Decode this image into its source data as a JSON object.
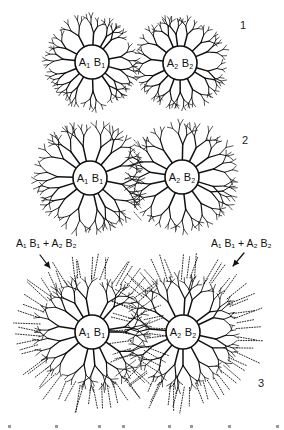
{
  "figure": {
    "type": "neuron-dendrite-growth-diagram",
    "ink_color": "#111111",
    "background": "#ffffff",
    "stages": [
      {
        "label": "1",
        "label_pos": [
          240,
          19
        ],
        "cells": [
          {
            "id": "A1B1",
            "text_a": "A",
            "sub_a": "1",
            "text_b": "B",
            "sub_b": "1",
            "cx": 92,
            "cy": 62,
            "r": 17,
            "reach": 46,
            "dotted_reach": 0,
            "seed": 11
          },
          {
            "id": "A2B2",
            "text_a": "A",
            "sub_a": "2",
            "text_b": "B",
            "sub_b": "2",
            "cx": 180,
            "cy": 63,
            "r": 17,
            "reach": 46,
            "dotted_reach": 0,
            "seed": 23
          }
        ]
      },
      {
        "label": "2",
        "label_pos": [
          242,
          134
        ],
        "cells": [
          {
            "id": "A1B1",
            "text_a": "A",
            "sub_a": "1",
            "text_b": "B",
            "sub_b": "1",
            "cx": 90,
            "cy": 178,
            "r": 17,
            "reach": 54,
            "dotted_reach": 0,
            "seed": 37
          },
          {
            "id": "A2B2",
            "text_a": "A",
            "sub_a": "2",
            "text_b": "B",
            "sub_b": "2",
            "cx": 182,
            "cy": 177,
            "r": 17,
            "reach": 54,
            "dotted_reach": 0,
            "seed": 41
          }
        ],
        "overlap_dots": {
          "x": 137,
          "y1": 140,
          "y2": 215
        }
      },
      {
        "label": "3",
        "label_pos": [
          258,
          377
        ],
        "cells": [
          {
            "id": "A1B1",
            "text_a": "A",
            "sub_a": "1",
            "text_b": "B",
            "sub_b": "1",
            "cx": 92,
            "cy": 332,
            "r": 17,
            "reach": 56,
            "dotted_reach": 80,
            "seed": 53
          },
          {
            "id": "A2B2",
            "text_a": "A",
            "sub_a": "2",
            "text_b": "B",
            "sub_b": "2",
            "cx": 183,
            "cy": 332,
            "r": 17,
            "reach": 56,
            "dotted_reach": 80,
            "seed": 67
          }
        ],
        "annotations": [
          {
            "text": "A₁ B₁ + A₂ B₂",
            "pos": [
              16,
              237
            ],
            "arrow_from": [
              40,
              255
            ],
            "arrow_to": [
              50,
              268
            ]
          },
          {
            "text": "A₁ B₁ + A₂ B₂",
            "pos": [
              211,
              237
            ],
            "arrow_from": [
              244,
              253
            ],
            "arrow_to": [
              233,
              266
            ]
          }
        ]
      }
    ],
    "bottom_cutoff_text": "(illegible, cropped)"
  }
}
